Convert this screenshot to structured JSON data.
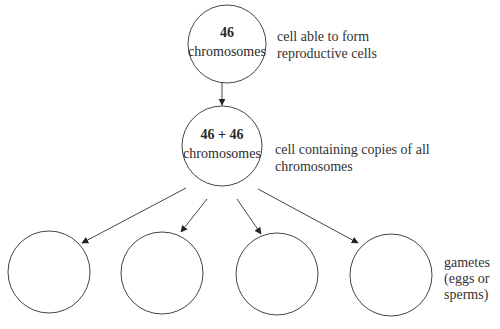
{
  "diagram": {
    "type": "flow",
    "nodes": [
      {
        "id": "parent-cell",
        "count": "46",
        "unit": "chromosomes",
        "description": [
          "cell able to form",
          "reproductive cells"
        ]
      },
      {
        "id": "replicated-cell",
        "count": "46 + 46",
        "unit": "chromosomes",
        "description": [
          "cell containing copies of all",
          "chromosomes"
        ]
      },
      {
        "id": "gamete-1",
        "count": "",
        "unit": ""
      },
      {
        "id": "gamete-2",
        "count": "",
        "unit": ""
      },
      {
        "id": "gamete-3",
        "count": "",
        "unit": ""
      },
      {
        "id": "gamete-4",
        "count": "",
        "unit": ""
      }
    ],
    "edges": [
      [
        "parent-cell",
        "replicated-cell"
      ],
      [
        "replicated-cell",
        "gamete-1"
      ],
      [
        "replicated-cell",
        "gamete-2"
      ],
      [
        "replicated-cell",
        "gamete-3"
      ],
      [
        "replicated-cell",
        "gamete-4"
      ]
    ],
    "gametes_label": [
      "gametes",
      "(eggs or",
      "sperms)"
    ]
  },
  "colors": {
    "stroke": "#444444",
    "text": "#2a2a2a",
    "background": "#ffffff"
  }
}
